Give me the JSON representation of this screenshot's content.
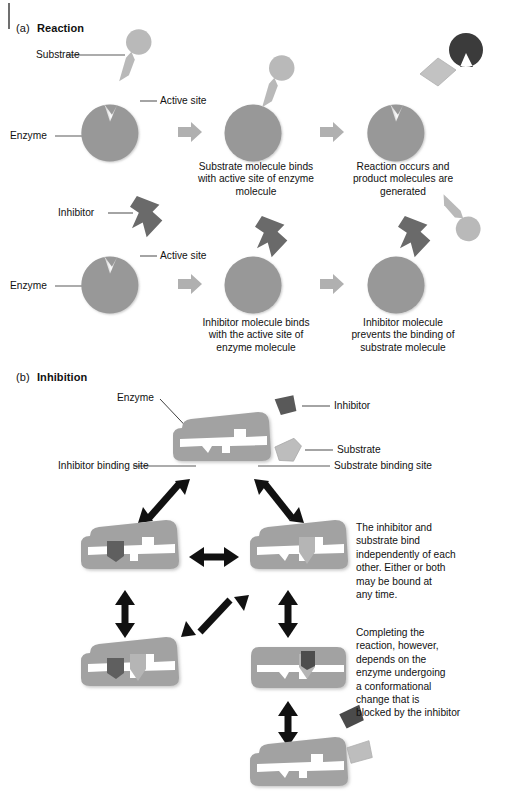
{
  "figure": {
    "panels": [
      {
        "id": "a",
        "prefix": "(a)",
        "title": "Reaction"
      },
      {
        "id": "b",
        "prefix": "(b)",
        "title": "Inhibition"
      }
    ]
  },
  "colors": {
    "enzyme_gray": "#989898",
    "enzyme_gray_light": "#a8a8a8",
    "substrate_gray": "#b9b9b9",
    "inhibitor_gray": "#6a6a6a",
    "product_dark": "#3b3b3b",
    "product_light": "#c2c2c2",
    "arrow_block": "#b0b0b0",
    "arrow_black": "#111111",
    "leader_line": "#5a5a5a",
    "text": "#111111",
    "background": "#ffffff"
  },
  "panel_a": {
    "row_substrate": {
      "labels": [
        {
          "name": "substrate",
          "text": "Substrate"
        },
        {
          "name": "active-site",
          "text": "Active site"
        },
        {
          "name": "enzyme",
          "text": "Enzyme"
        }
      ],
      "captions": [
        {
          "name": "caption-step2",
          "lines": [
            "Substrate molecule binds",
            "with active site of enzyme",
            "molecule"
          ]
        },
        {
          "name": "caption-step3",
          "lines": [
            "Reaction occurs and",
            "product molecules are",
            "generated"
          ]
        }
      ]
    },
    "row_inhibitor": {
      "labels": [
        {
          "name": "inhibitor",
          "text": "Inhibitor"
        },
        {
          "name": "active-site",
          "text": "Active site"
        },
        {
          "name": "enzyme",
          "text": "Enzyme"
        }
      ],
      "captions": [
        {
          "name": "caption-step2",
          "lines": [
            "Inhibitor molecule binds",
            "with the active site of",
            "enzyme molecule"
          ]
        },
        {
          "name": "caption-step3",
          "lines": [
            "Inhibitor molecule",
            "prevents the binding of",
            "substrate molecule"
          ]
        }
      ]
    }
  },
  "panel_b": {
    "labels": [
      {
        "name": "enzyme",
        "text": "Enzyme"
      },
      {
        "name": "inhibitor",
        "text": "Inhibitor"
      },
      {
        "name": "substrate",
        "text": "Substrate"
      },
      {
        "name": "inhibitor-binding-site",
        "text": "Inhibitor binding site"
      },
      {
        "name": "substrate-binding-site",
        "text": "Substrate binding site"
      }
    ],
    "notes": [
      {
        "name": "note-independent-binding",
        "lines": [
          "The inhibitor and",
          "substrate bind",
          "independently of each",
          "other. Either or both",
          "may be bound at",
          "any time."
        ]
      },
      {
        "name": "note-conformational-change",
        "lines": [
          "Completing the",
          "reaction, however,",
          "depends on the",
          "enzyme undergoing",
          "a conformational",
          "change that is",
          "blocked by the inhibitor"
        ]
      }
    ],
    "states": [
      {
        "name": "state-free-enzyme",
        "inhibitor_bound": false,
        "substrate_bound": false,
        "conformation": "open"
      },
      {
        "name": "state-inhibitor-bound",
        "inhibitor_bound": true,
        "substrate_bound": false,
        "conformation": "open"
      },
      {
        "name": "state-substrate-bound",
        "inhibitor_bound": false,
        "substrate_bound": true,
        "conformation": "open"
      },
      {
        "name": "state-both-bound-open",
        "inhibitor_bound": true,
        "substrate_bound": true,
        "conformation": "open"
      },
      {
        "name": "state-substrate-bound-closed",
        "inhibitor_bound": true,
        "substrate_bound": true,
        "conformation": "closed"
      },
      {
        "name": "state-products-released",
        "inhibitor_bound": false,
        "substrate_bound": false,
        "conformation": "open"
      }
    ]
  }
}
